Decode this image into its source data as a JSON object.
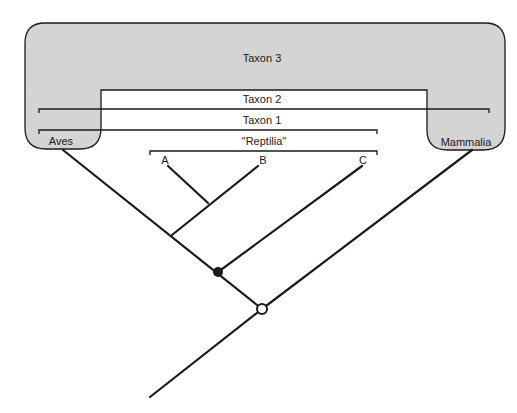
{
  "diagram": {
    "type": "cladogram",
    "groups": {
      "taxon3": "Taxon 3",
      "taxon2": "Taxon 2",
      "taxon1": "Taxon 1",
      "reptilia": "\"Reptilia\""
    },
    "taxa": {
      "aves": "Aves",
      "mammalia": "Mammalia",
      "a": "A",
      "b": "B",
      "c": "C"
    },
    "nodes": [
      {
        "name": "filled-node",
        "style": "filled"
      },
      {
        "name": "open-node",
        "style": "open"
      }
    ],
    "colors": {
      "shaded_region": "#d4d4d4",
      "line": "#1a1a1a",
      "background": "#ffffff"
    }
  }
}
